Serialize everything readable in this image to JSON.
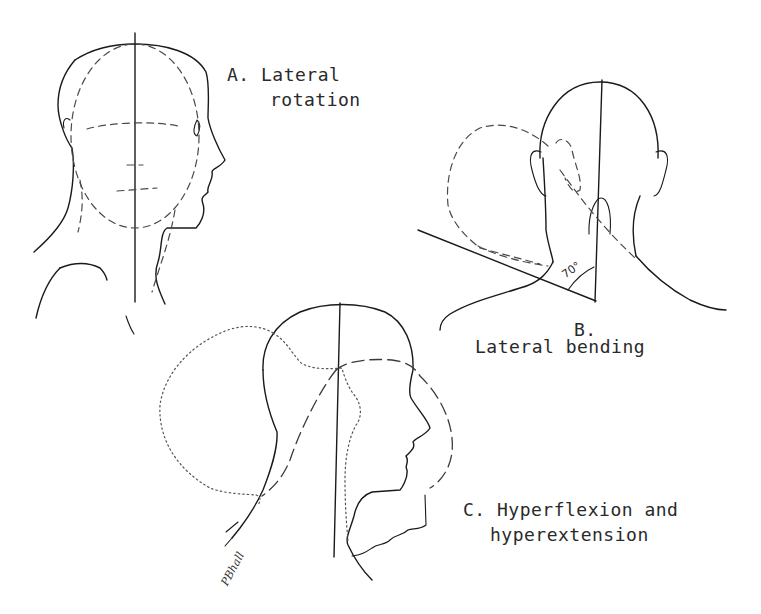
{
  "figure": {
    "panels": [
      {
        "id": "A",
        "label_line1": "A. Lateral",
        "label_line2": "rotation",
        "view": "side profile, facing right; dashed oval shows rotated head"
      },
      {
        "id": "B",
        "label_line1": "B.",
        "label_line2": "Lateral bending",
        "view": "rear view; dashed outline shows head bent to the left",
        "angle_label": "70°"
      },
      {
        "id": "C",
        "label_line1": "C. Hyperflexion and",
        "label_line2": "hyperextension",
        "view": "side profile facing right; dotted outline = flexion back, dashed outline = extension forward"
      }
    ],
    "signature": "PBhall"
  },
  "colors": {
    "background": "#ffffff",
    "ink": "#1a1a1a"
  }
}
